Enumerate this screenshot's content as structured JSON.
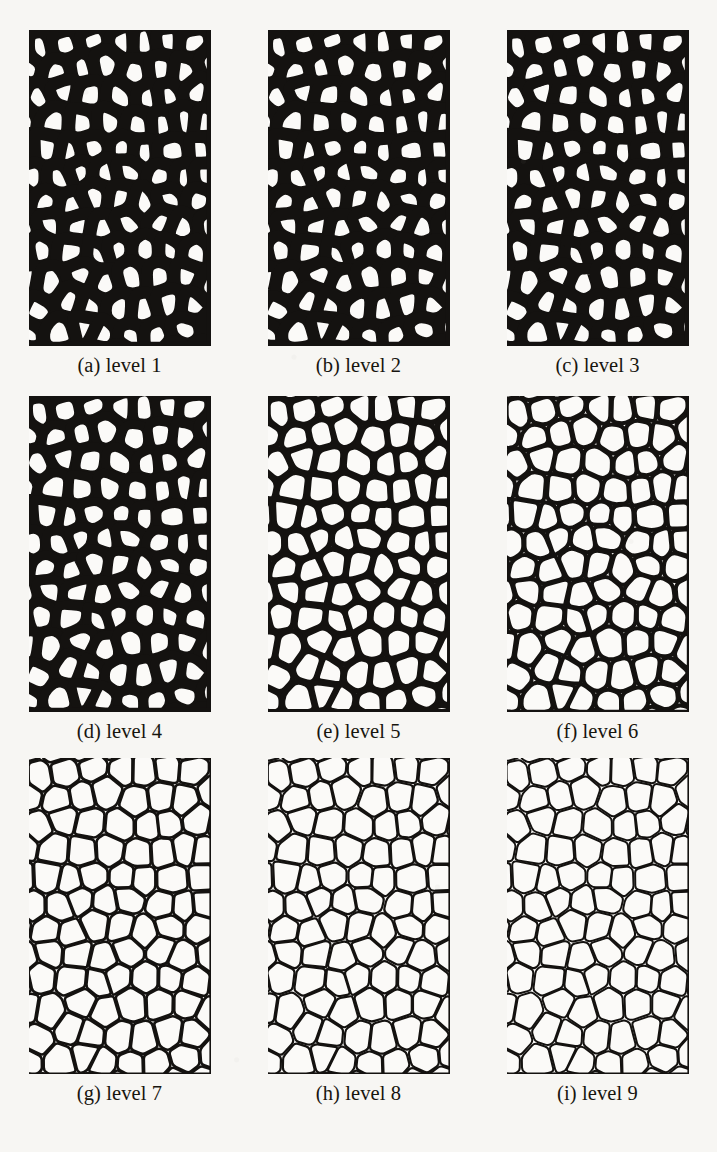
{
  "figure": {
    "kind": "image-grid",
    "rows": 3,
    "columns": 3,
    "background_color": "#f7f6f3",
    "ink_color": "#141210",
    "cell_fill_color": "#fbfaf8"
  },
  "panels": [
    {
      "tag": "(a)",
      "label": "level 1",
      "caption": "(a) level 1",
      "level": 1,
      "stroke_px": 12.0
    },
    {
      "tag": "(b)",
      "label": "level 2",
      "caption": "(b) level 2",
      "level": 2,
      "stroke_px": 11.4
    },
    {
      "tag": "(c)",
      "label": "level 3",
      "caption": "(c) level 3",
      "level": 3,
      "stroke_px": 10.8
    },
    {
      "tag": "(d)",
      "label": "level 4",
      "caption": "(d) level 4",
      "level": 4,
      "stroke_px": 9.2
    },
    {
      "tag": "(e)",
      "label": "level 5",
      "caption": "(e) level 5",
      "level": 5,
      "stroke_px": 5.4
    },
    {
      "tag": "(f)",
      "label": "level 6",
      "caption": "(f) level 6",
      "level": 6,
      "stroke_px": 4.0
    },
    {
      "tag": "(g)",
      "label": "level 7",
      "caption": "(g) level 7",
      "level": 7,
      "stroke_px": 2.6
    },
    {
      "tag": "(h)",
      "label": "level 8",
      "caption": "(h) level 8",
      "level": 8,
      "stroke_px": 2.2
    },
    {
      "tag": "(i)",
      "label": "level 9",
      "caption": "(i) level 9",
      "level": 9,
      "stroke_px": 2.0
    }
  ],
  "chart_data": {
    "type": "heatmap",
    "title": "",
    "xlabel": "",
    "ylabel": "",
    "categories": [
      "level 1",
      "level 2",
      "level 3",
      "level 4",
      "level 5",
      "level 6",
      "level 7",
      "level 8",
      "level 9"
    ],
    "series": [
      {
        "name": "boundary thickness (px)",
        "values": [
          12.0,
          11.4,
          10.8,
          9.2,
          5.4,
          4.0,
          2.6,
          2.2,
          2.0
        ]
      }
    ]
  }
}
